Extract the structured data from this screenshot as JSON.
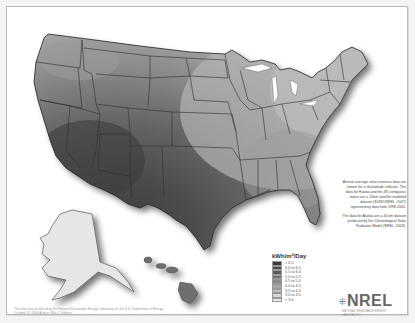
{
  "map": {
    "title": "Annual average solar resource (U.S.)",
    "legend": {
      "title": "kWh/m²/Day",
      "items": [
        {
          "label": "> 6.5",
          "color": "#3a3a3a"
        },
        {
          "label": "6.0 to 6.5",
          "color": "#4c4c4c"
        },
        {
          "label": "5.5 to 6.0",
          "color": "#5e5e5e"
        },
        {
          "label": "5.0 to 5.5",
          "color": "#727272"
        },
        {
          "label": "4.5 to 5.0",
          "color": "#8a8a8a"
        },
        {
          "label": "4.0 to 4.5",
          "color": "#a4a4a4"
        },
        {
          "label": "3.5 to 4.0",
          "color": "#bebebe"
        },
        {
          "label": "3.0 to 3.5",
          "color": "#d6d6d6"
        },
        {
          "label": "< 3.0",
          "color": "#ececec"
        }
      ]
    },
    "description": {
      "p1": "Annual average solar resource data are shown for a tilt=latitude collector. The data for Hawaii and the 48 contiguous states are a 10km satellite modeled dataset (SUNY/NREL, 2007) representing data from 1998-2005.",
      "p2": "The data for Alaska are a 40 km dataset produced by the Climatological Solar Radiation Model (NREL, 2003)."
    },
    "logo": {
      "mark": "⁜",
      "text": "NREL",
      "subtitle": "NATIONAL RENEWABLE ENERGY LABORATORY"
    },
    "credit": {
      "line1": "This map was produced by the National Renewable Energy Laboratory for the U.S. Department of Energy.",
      "line2": "October 13, 2008  Author: Billy J. Roberts"
    },
    "colors": {
      "frame_border": "#b8b8b8",
      "state_line": "#2f2f2f",
      "background": "#ffffff"
    }
  }
}
